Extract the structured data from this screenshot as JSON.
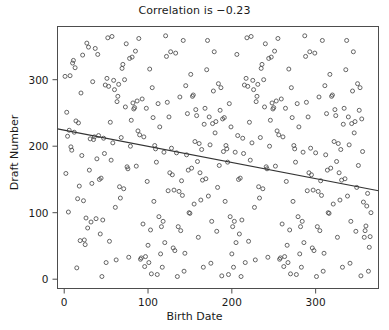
{
  "chart_data": {
    "type": "scatter",
    "title": "Correlation is −0.23",
    "xlabel": "Birth Date",
    "ylabel": "Draft Number",
    "xlim": [
      -8,
      375
    ],
    "ylim": [
      -14,
      380
    ],
    "xticks": [
      0,
      100,
      200,
      300
    ],
    "yticks": [
      0,
      100,
      200,
      300
    ],
    "grid": false,
    "legend": null,
    "correlation": -0.23,
    "marker": {
      "shape": "open-circle",
      "size": 4,
      "color": "#555555",
      "fill": "none"
    },
    "trendline": {
      "type": "linear-fit",
      "color": "#333333",
      "x": [
        -8,
        375
      ],
      "y": [
        226,
        133
      ],
      "slope": -0.2428,
      "intercept": 224.1
    },
    "n_points": 366,
    "points": [
      [
        1,
        305
      ],
      [
        2,
        159
      ],
      [
        3,
        251
      ],
      [
        4,
        215
      ],
      [
        5,
        101
      ],
      [
        6,
        224
      ],
      [
        7,
        306
      ],
      [
        8,
        199
      ],
      [
        9,
        194
      ],
      [
        10,
        325
      ],
      [
        11,
        329
      ],
      [
        12,
        221
      ],
      [
        13,
        318
      ],
      [
        14,
        238
      ],
      [
        15,
        17
      ],
      [
        16,
        121
      ],
      [
        17,
        235
      ],
      [
        18,
        140
      ],
      [
        19,
        58
      ],
      [
        20,
        280
      ],
      [
        21,
        186
      ],
      [
        22,
        337
      ],
      [
        23,
        118
      ],
      [
        24,
        59
      ],
      [
        25,
        52
      ],
      [
        26,
        92
      ],
      [
        27,
        355
      ],
      [
        28,
        77
      ],
      [
        29,
        349
      ],
      [
        30,
        164
      ],
      [
        31,
        211
      ],
      [
        32,
        86
      ],
      [
        33,
        144
      ],
      [
        34,
        297
      ],
      [
        35,
        210
      ],
      [
        36,
        214
      ],
      [
        37,
        347
      ],
      [
        38,
        91
      ],
      [
        39,
        181
      ],
      [
        40,
        338
      ],
      [
        41,
        216
      ],
      [
        42,
        150
      ],
      [
        43,
        68
      ],
      [
        44,
        152
      ],
      [
        45,
        4
      ],
      [
        46,
        89
      ],
      [
        47,
        212
      ],
      [
        48,
        189
      ],
      [
        49,
        292
      ],
      [
        50,
        25
      ],
      [
        51,
        302
      ],
      [
        52,
        363
      ],
      [
        53,
        290
      ],
      [
        54,
        57
      ],
      [
        55,
        236
      ],
      [
        56,
        179
      ],
      [
        57,
        365
      ],
      [
        58,
        205
      ],
      [
        59,
        299
      ],
      [
        60,
        285
      ],
      [
        61,
        108
      ],
      [
        62,
        29
      ],
      [
        63,
        267
      ],
      [
        64,
        275
      ],
      [
        65,
        293
      ],
      [
        66,
        139
      ],
      [
        67,
        122
      ],
      [
        68,
        213
      ],
      [
        69,
        317
      ],
      [
        70,
        323
      ],
      [
        71,
        136
      ],
      [
        72,
        300
      ],
      [
        73,
        259
      ],
      [
        74,
        354
      ],
      [
        75,
        169
      ],
      [
        76,
        166
      ],
      [
        77,
        33
      ],
      [
        78,
        332
      ],
      [
        79,
        200
      ],
      [
        80,
        239
      ],
      [
        81,
        334
      ],
      [
        82,
        265
      ],
      [
        83,
        256
      ],
      [
        84,
        258
      ],
      [
        85,
        343
      ],
      [
        86,
        170
      ],
      [
        87,
        268
      ],
      [
        88,
        223
      ],
      [
        89,
        362
      ],
      [
        90,
        217
      ],
      [
        91,
        30
      ],
      [
        92,
        32
      ],
      [
        93,
        271
      ],
      [
        94,
        83
      ],
      [
        95,
        214
      ],
      [
        96,
        19
      ],
      [
        97,
        34
      ],
      [
        98,
        257
      ],
      [
        99,
        147
      ],
      [
        100,
        51
      ],
      [
        101,
        25
      ],
      [
        102,
        316
      ],
      [
        103,
        74
      ],
      [
        104,
        8
      ],
      [
        105,
        288
      ],
      [
        106,
        243
      ],
      [
        107,
        117
      ],
      [
        108,
        201
      ],
      [
        109,
        196
      ],
      [
        110,
        176
      ],
      [
        111,
        7
      ],
      [
        112,
        264
      ],
      [
        113,
        94
      ],
      [
        114,
        229
      ],
      [
        115,
        38
      ],
      [
        116,
        79
      ],
      [
        117,
        18
      ],
      [
        118,
        87
      ],
      [
        119,
        191
      ],
      [
        120,
        55
      ],
      [
        121,
        366
      ],
      [
        122,
        335
      ],
      [
        123,
        266
      ],
      [
        124,
        133
      ],
      [
        125,
        244
      ],
      [
        126,
        160
      ],
      [
        127,
        342
      ],
      [
        128,
        197
      ],
      [
        129,
        157
      ],
      [
        130,
        47
      ],
      [
        131,
        134
      ],
      [
        132,
        43
      ],
      [
        133,
        340
      ],
      [
        134,
        190
      ],
      [
        135,
        4
      ],
      [
        136,
        79
      ],
      [
        137,
        132
      ],
      [
        138,
        274
      ],
      [
        139,
        73
      ],
      [
        140,
        148
      ],
      [
        141,
        126
      ],
      [
        142,
        359
      ],
      [
        143,
        12
      ],
      [
        144,
        39
      ],
      [
        145,
        291
      ],
      [
        146,
        187
      ],
      [
        147,
        249
      ],
      [
        148,
        164
      ],
      [
        149,
        100
      ],
      [
        150,
        99
      ],
      [
        151,
        308
      ],
      [
        152,
        167
      ],
      [
        153,
        275
      ],
      [
        154,
        277
      ],
      [
        155,
        113
      ],
      [
        156,
        207
      ],
      [
        157,
        255
      ],
      [
        158,
        246
      ],
      [
        159,
        177
      ],
      [
        160,
        63
      ],
      [
        161,
        204
      ],
      [
        162,
        160
      ],
      [
        163,
        119
      ],
      [
        164,
        195
      ],
      [
        165,
        149
      ],
      [
        166,
        18
      ],
      [
        167,
        233
      ],
      [
        168,
        257
      ],
      [
        169,
        151
      ],
      [
        170,
        315
      ],
      [
        171,
        359
      ],
      [
        172,
        125
      ],
      [
        173,
        244
      ],
      [
        174,
        202
      ],
      [
        175,
        24
      ],
      [
        176,
        87
      ],
      [
        177,
        234
      ],
      [
        178,
        283
      ],
      [
        179,
        342
      ],
      [
        180,
        220
      ],
      [
        181,
        237
      ],
      [
        182,
        72
      ],
      [
        183,
        138
      ],
      [
        184,
        294
      ],
      [
        185,
        171
      ],
      [
        186,
        254
      ],
      [
        187,
        288
      ],
      [
        188,
        5
      ],
      [
        189,
        241
      ],
      [
        190,
        192
      ],
      [
        191,
        243
      ],
      [
        192,
        117
      ],
      [
        193,
        201
      ],
      [
        194,
        196
      ],
      [
        195,
        176
      ],
      [
        196,
        7
      ],
      [
        197,
        264
      ],
      [
        198,
        94
      ],
      [
        199,
        229
      ],
      [
        200,
        38
      ],
      [
        201,
        79
      ],
      [
        202,
        18
      ],
      [
        203,
        87
      ],
      [
        204,
        191
      ],
      [
        205,
        55
      ],
      [
        206,
        338
      ],
      [
        207,
        216
      ],
      [
        208,
        150
      ],
      [
        209,
        68
      ],
      [
        210,
        152
      ],
      [
        211,
        4
      ],
      [
        212,
        89
      ],
      [
        213,
        212
      ],
      [
        214,
        189
      ],
      [
        215,
        292
      ],
      [
        216,
        25
      ],
      [
        217,
        302
      ],
      [
        218,
        363
      ],
      [
        219,
        290
      ],
      [
        220,
        57
      ],
      [
        221,
        236
      ],
      [
        222,
        179
      ],
      [
        223,
        365
      ],
      [
        224,
        205
      ],
      [
        225,
        299
      ],
      [
        226,
        285
      ],
      [
        227,
        108
      ],
      [
        228,
        29
      ],
      [
        229,
        267
      ],
      [
        230,
        275
      ],
      [
        231,
        293
      ],
      [
        232,
        139
      ],
      [
        233,
        122
      ],
      [
        234,
        213
      ],
      [
        235,
        317
      ],
      [
        236,
        323
      ],
      [
        237,
        136
      ],
      [
        238,
        300
      ],
      [
        239,
        259
      ],
      [
        240,
        354
      ],
      [
        241,
        169
      ],
      [
        242,
        166
      ],
      [
        243,
        33
      ],
      [
        244,
        332
      ],
      [
        245,
        200
      ],
      [
        246,
        239
      ],
      [
        247,
        334
      ],
      [
        248,
        265
      ],
      [
        249,
        256
      ],
      [
        250,
        258
      ],
      [
        251,
        343
      ],
      [
        252,
        170
      ],
      [
        253,
        268
      ],
      [
        254,
        223
      ],
      [
        255,
        362
      ],
      [
        256,
        217
      ],
      [
        257,
        30
      ],
      [
        258,
        32
      ],
      [
        259,
        271
      ],
      [
        260,
        83
      ],
      [
        261,
        214
      ],
      [
        262,
        19
      ],
      [
        263,
        34
      ],
      [
        264,
        257
      ],
      [
        265,
        147
      ],
      [
        266,
        51
      ],
      [
        267,
        25
      ],
      [
        268,
        316
      ],
      [
        269,
        74
      ],
      [
        270,
        8
      ],
      [
        271,
        288
      ],
      [
        272,
        243
      ],
      [
        273,
        117
      ],
      [
        274,
        201
      ],
      [
        275,
        196
      ],
      [
        276,
        176
      ],
      [
        277,
        7
      ],
      [
        278,
        264
      ],
      [
        279,
        94
      ],
      [
        280,
        229
      ],
      [
        281,
        38
      ],
      [
        282,
        79
      ],
      [
        283,
        18
      ],
      [
        284,
        87
      ],
      [
        285,
        191
      ],
      [
        286,
        55
      ],
      [
        287,
        366
      ],
      [
        288,
        335
      ],
      [
        289,
        266
      ],
      [
        290,
        133
      ],
      [
        291,
        244
      ],
      [
        292,
        160
      ],
      [
        293,
        342
      ],
      [
        294,
        197
      ],
      [
        295,
        157
      ],
      [
        296,
        47
      ],
      [
        297,
        134
      ],
      [
        298,
        43
      ],
      [
        299,
        340
      ],
      [
        300,
        190
      ],
      [
        301,
        4
      ],
      [
        302,
        79
      ],
      [
        303,
        132
      ],
      [
        304,
        274
      ],
      [
        305,
        73
      ],
      [
        306,
        148
      ],
      [
        307,
        126
      ],
      [
        308,
        359
      ],
      [
        309,
        12
      ],
      [
        310,
        39
      ],
      [
        311,
        291
      ],
      [
        312,
        187
      ],
      [
        313,
        249
      ],
      [
        314,
        164
      ],
      [
        315,
        100
      ],
      [
        316,
        99
      ],
      [
        317,
        308
      ],
      [
        318,
        167
      ],
      [
        319,
        275
      ],
      [
        320,
        277
      ],
      [
        321,
        113
      ],
      [
        322,
        207
      ],
      [
        323,
        255
      ],
      [
        324,
        246
      ],
      [
        325,
        177
      ],
      [
        326,
        63
      ],
      [
        327,
        204
      ],
      [
        328,
        160
      ],
      [
        329,
        119
      ],
      [
        330,
        195
      ],
      [
        331,
        149
      ],
      [
        332,
        18
      ],
      [
        333,
        233
      ],
      [
        334,
        257
      ],
      [
        335,
        151
      ],
      [
        336,
        315
      ],
      [
        337,
        359
      ],
      [
        338,
        125
      ],
      [
        339,
        244
      ],
      [
        340,
        202
      ],
      [
        341,
        24
      ],
      [
        342,
        87
      ],
      [
        343,
        234
      ],
      [
        344,
        283
      ],
      [
        345,
        342
      ],
      [
        346,
        220
      ],
      [
        347,
        237
      ],
      [
        348,
        72
      ],
      [
        349,
        138
      ],
      [
        350,
        294
      ],
      [
        351,
        171
      ],
      [
        352,
        254
      ],
      [
        353,
        288
      ],
      [
        354,
        5
      ],
      [
        355,
        241
      ],
      [
        356,
        192
      ],
      [
        357,
        116
      ],
      [
        358,
        63
      ],
      [
        359,
        73
      ],
      [
        360,
        80
      ],
      [
        361,
        110
      ],
      [
        362,
        129
      ],
      [
        363,
        12
      ],
      [
        364,
        48
      ],
      [
        365,
        64
      ],
      [
        366,
        100
      ]
    ]
  }
}
